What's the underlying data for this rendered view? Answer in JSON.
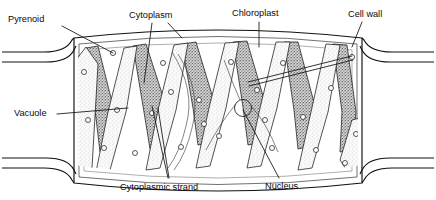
{
  "figure": {
    "type": "biological-diagram",
    "background_color": "#ffffff",
    "ink_color": "#111111"
  },
  "labels": [
    {
      "id": "pyrenoid",
      "text": "Pyrenoid",
      "x": 8,
      "y": 20,
      "anchor": "start"
    },
    {
      "id": "cytoplasm",
      "text": "Cytoplasm",
      "x": 129,
      "y": 16,
      "anchor": "start"
    },
    {
      "id": "chloroplast",
      "text": "Chloroplast",
      "x": 232,
      "y": 14,
      "anchor": "start"
    },
    {
      "id": "cell-wall",
      "text": "Cell wall",
      "x": 348,
      "y": 15,
      "anchor": "start"
    },
    {
      "id": "vacuole",
      "text": "Vacuole",
      "x": 14,
      "y": 114,
      "anchor": "start"
    },
    {
      "id": "cytoplasmic-strand",
      "text": "Cytoplasmic strand",
      "x": 120,
      "y": 188,
      "anchor": "start"
    },
    {
      "id": "nucleus",
      "text": "Nucleus",
      "x": 265,
      "y": 187,
      "anchor": "start"
    }
  ],
  "leaders": [
    {
      "id": "leader-pyrenoid-left",
      "for": "pyrenoid",
      "path": "M 62,26 L 113,53"
    },
    {
      "id": "leader-pyrenoid-right-a",
      "for": "pyrenoid",
      "path": "M 248,82 L 352,56"
    },
    {
      "id": "leader-pyrenoid-right-b",
      "for": "pyrenoid",
      "path": "M 249,86 L 353,60"
    },
    {
      "id": "leader-cytoplasm",
      "for": "cytoplasm",
      "path": "M 168,23 L 182,38"
    },
    {
      "id": "leader-cytoplasm-b",
      "for": "cytoplasm",
      "path": "M 152,23 L 144,83"
    },
    {
      "id": "leader-chloroplast",
      "for": "chloroplast",
      "path": "M 259,22 L 259,47"
    },
    {
      "id": "leader-cell-wall",
      "for": "cell-wall",
      "path": "M 362,22 L 352,47"
    },
    {
      "id": "leader-vacuole",
      "for": "vacuole",
      "path": "M 57,114 L 128,108"
    },
    {
      "id": "leader-strand-a",
      "for": "cytoplasmic-strand",
      "path": "M 168,178 L 152,106"
    },
    {
      "id": "leader-strand-b",
      "for": "cytoplasmic-strand",
      "path": "M 169,178 L 158,108"
    },
    {
      "id": "leader-nucleus",
      "for": "nucleus",
      "path": "M 279,178 L 243,110"
    }
  ],
  "structures": {
    "cell_wall": {
      "name": "cell-wall-outline",
      "description": "Rectangular algal cell with outward-bowed top and bottom walls and flared end walls",
      "left": 74,
      "right": 362,
      "top": 38,
      "bottom": 172
    },
    "chloroplast": {
      "name": "helical-chloroplast-ribbons",
      "count": 6,
      "description": "Spiral ribbon-shaped chloroplasts running as a zigzag band around the cell periphery",
      "fill_light": "#f2f2f2",
      "fill_dark": "#8f8f8f"
    },
    "pyrenoids": {
      "name": "pyrenoid-granules",
      "count": 22,
      "radius": 2.6,
      "description": "Small circular protein bodies embedded along each chloroplast ribbon"
    },
    "nucleus": {
      "name": "central-nucleus",
      "cx": 243,
      "cy": 108,
      "r": 8.5,
      "description": "Nucleus suspended in the centre of the cell by cytoplasmic strands"
    },
    "vacuole": {
      "name": "central-vacuole",
      "description": "Large clear space filling the cell interior between chloroplast ribbons"
    },
    "cytoplasmic_strands": {
      "name": "cytoplasmic-strands",
      "count": 4,
      "description": "Fine threads of cytoplasm suspending the nucleus"
    }
  }
}
